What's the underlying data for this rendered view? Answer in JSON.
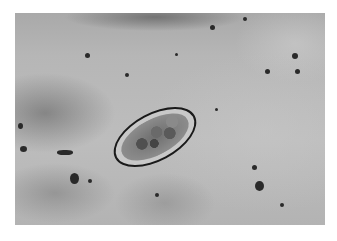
{
  "image": {
    "kind": "grayscale light micrograph",
    "subject": "oval parasite egg with thin dark shell and granular interior",
    "background_tone": "#b8b8b8",
    "shell_color": "#1a1a1a"
  },
  "caption": {
    "text": ""
  }
}
